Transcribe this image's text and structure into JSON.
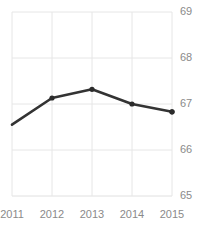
{
  "chart_data": {
    "type": "line",
    "title": "Freedom Trend",
    "xlabel": "",
    "ylabel": "",
    "categories": [
      "2011",
      "2012",
      "2013",
      "2014",
      "2015"
    ],
    "x": [
      2011,
      2012,
      2013,
      2014,
      2015
    ],
    "values": [
      66.55,
      67.13,
      67.32,
      67.0,
      66.83
    ],
    "series": [
      {
        "name": "Freedom Trend",
        "values": [
          66.55,
          67.13,
          67.32,
          67.0,
          66.83
        ]
      }
    ],
    "ylim": [
      65,
      69
    ],
    "xlim": [
      2011,
      2015
    ],
    "yticks": [
      65,
      66,
      67,
      68,
      69
    ],
    "ytick_labels": [
      "65",
      "66",
      "67",
      "68",
      "69"
    ],
    "xticks": [
      2011,
      2012,
      2013,
      2014,
      2015
    ],
    "xtick_labels": [
      "2011",
      "2012",
      "2013",
      "2014",
      "2015"
    ],
    "grid": true,
    "legend": false,
    "legend_position": "none",
    "y_axis_side": "right",
    "marker": "circle",
    "colors": {
      "line": "#333333",
      "marker": "#2b2b2b",
      "grid": "#e6e6e6",
      "tick_label": "#8a8a8a",
      "title": "#4a4a4a",
      "background": "#ffffff"
    }
  }
}
